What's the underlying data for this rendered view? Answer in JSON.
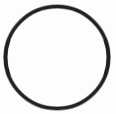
{
  "canvas": {
    "width": 116,
    "height": 114,
    "background_color": "#fdfdfc",
    "description": "Plain white square canvas containing a single hand-drawn style circular ring outline",
    "alt_text": "Circle outline"
  },
  "figure": {
    "name": "circle-outline",
    "icon_name": "circle-outline-icon",
    "shape_type": "ring",
    "filled": false,
    "label": "",
    "stroke_color": "#212121",
    "stroke_color_soft": "#3a3a3a",
    "fill_color": "none",
    "interior_color": "#ffffff",
    "stroke_width": 3.1,
    "stroke_width_minor": 2.4,
    "center_x": 57,
    "center_y": 57.5,
    "radius_x": 51.5,
    "radius_y": 51,
    "bounds": {
      "left": 4,
      "top": 5,
      "right": 110,
      "bottom": 110
    }
  },
  "text": {
    "has_text": "false",
    "strings": []
  }
}
